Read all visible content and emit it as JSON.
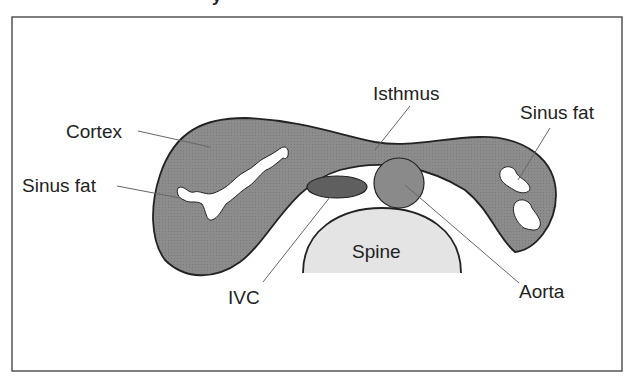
{
  "figure": {
    "title_fragment": "y",
    "labels": {
      "cortex": "Cortex",
      "sinus_fat_left": "Sinus fat",
      "isthmus": "Isthmus",
      "sinus_fat_right": "Sinus fat",
      "spine": "Spine",
      "ivc": "IVC",
      "aorta": "Aorta"
    },
    "colors": {
      "kidney_fill": "#8c8c8c",
      "kidney_outline": "#222222",
      "ivc_fill": "#5f5f5f",
      "aorta_fill": "#8a8a8a",
      "spine_fill": "#e4e4e4",
      "frame": "#555555",
      "background": "#ffffff"
    }
  }
}
